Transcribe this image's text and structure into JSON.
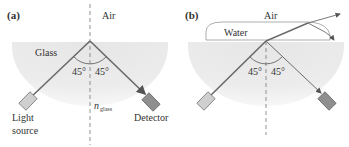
{
  "panel_a": {
    "label": "(a)",
    "medium_top": "Air",
    "medium_bottom": "Glass",
    "angle_left": "45°",
    "angle_right": "45°",
    "index_symbol": "n",
    "index_subscript": "glass",
    "source_label_line1": "Light",
    "source_label_line2": "source",
    "detector_label": "Detector"
  },
  "panel_b": {
    "label": "(b)",
    "medium_top": "Air",
    "medium_film": "Water",
    "angle_left": "45°",
    "angle_right": "45°"
  },
  "colors": {
    "glass": "#e9e9e9",
    "water": "#ffffff",
    "ray": "#6a6a6a",
    "source_box": "#c8c8c8",
    "detector_box": "#8c8c8c",
    "normal": "#777777"
  }
}
